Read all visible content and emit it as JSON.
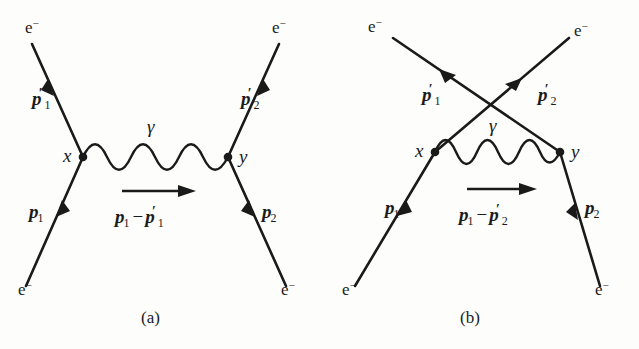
{
  "figure": {
    "type": "feynman-diagrams",
    "background_color": "#fdfdfb",
    "ink_color": "#1a1a1a"
  },
  "diagrams": [
    {
      "caption": "(a)",
      "topology": "direct t-channel, uncrossed external legs",
      "vertices": [
        {
          "label": "x",
          "x": 83,
          "y": 157
        },
        {
          "label": "y",
          "x": 228,
          "y": 157
        }
      ],
      "propagator": {
        "particle_label": "γ",
        "kind": "photon-wavy",
        "momentum_label": {
          "first": "p",
          "first_sub": "1",
          "operator": "−",
          "second": "p",
          "second_sub": "1",
          "second_prime": "′"
        },
        "arrow_direction": "right"
      },
      "legs": [
        {
          "name": "incoming-left",
          "particle": "e⁻",
          "momentum": "p",
          "subscript": "1",
          "prime": false,
          "arrow": "toward-vertex"
        },
        {
          "name": "outgoing-left",
          "particle": "e⁻",
          "momentum": "p",
          "subscript": "1",
          "prime": true,
          "arrow": "away-from-vertex"
        },
        {
          "name": "incoming-right",
          "particle": "e⁻",
          "momentum": "p",
          "subscript": "2",
          "prime": false,
          "arrow": "toward-vertex"
        },
        {
          "name": "outgoing-right",
          "particle": "e⁻",
          "momentum": "p",
          "subscript": "2",
          "prime": true,
          "arrow": "away-from-vertex"
        }
      ]
    },
    {
      "caption": "(b)",
      "topology": "exchange u-channel, crossed external legs",
      "vertices": [
        {
          "label": "x",
          "x": 116,
          "y": 152
        },
        {
          "label": "y",
          "x": 241,
          "y": 152
        }
      ],
      "propagator": {
        "particle_label": "γ",
        "kind": "photon-wavy",
        "momentum_label": {
          "first": "p",
          "first_sub": "1",
          "operator": "−",
          "second": "p",
          "second_sub": "2",
          "second_prime": "′"
        },
        "arrow_direction": "right"
      },
      "legs": [
        {
          "name": "incoming-left",
          "particle": "e⁻",
          "momentum": "p",
          "subscript": "1",
          "prime": false,
          "arrow": "toward-vertex"
        },
        {
          "name": "outgoing-upper-left",
          "particle": "e⁻",
          "momentum": "p",
          "subscript": "1",
          "prime": true,
          "arrow": "away-from-vertex"
        },
        {
          "name": "incoming-right",
          "particle": "e⁻",
          "momentum": "p",
          "subscript": "2",
          "prime": false,
          "arrow": "toward-vertex"
        },
        {
          "name": "outgoing-upper-right",
          "particle": "e⁻",
          "momentum": "p",
          "subscript": "2",
          "prime": true,
          "arrow": "away-from-vertex"
        }
      ]
    }
  ],
  "labels": {
    "electron": "e",
    "electron_charge": "−",
    "photon": "γ",
    "vertex_x": "x",
    "vertex_y": "y",
    "momentum_p": "p",
    "prime": "′",
    "sub_1": "1",
    "sub_2": "2",
    "minus": "−",
    "caption_a": "(a)",
    "caption_b": "(b)"
  }
}
